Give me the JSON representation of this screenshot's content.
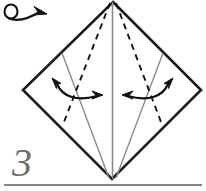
{
  "diagram": {
    "type": "origami-instruction-step",
    "step_number": "3",
    "background_color": "#ffffff",
    "ink_color": "#1a1a1a",
    "crease_color": "#808080",
    "step_number_color": "#6e6e6e",
    "symbols": {
      "turn_over_icon": "turn-over-loop-arrow",
      "valley_fold_line_style": "dashed",
      "existing_crease_line_style": "solid-gray",
      "fold_arrow_icon": "double-headed-curved-arrow"
    },
    "shape": {
      "name": "diamond",
      "vertices": {
        "top": [
          113,
          2
        ],
        "left": [
          23,
          90
        ],
        "bottom": [
          112,
          179
        ],
        "right": [
          201,
          90
        ]
      }
    },
    "separator_line": {
      "y": 185,
      "x_start": 4,
      "x_end": 202,
      "color": "#5a5a5a"
    }
  }
}
